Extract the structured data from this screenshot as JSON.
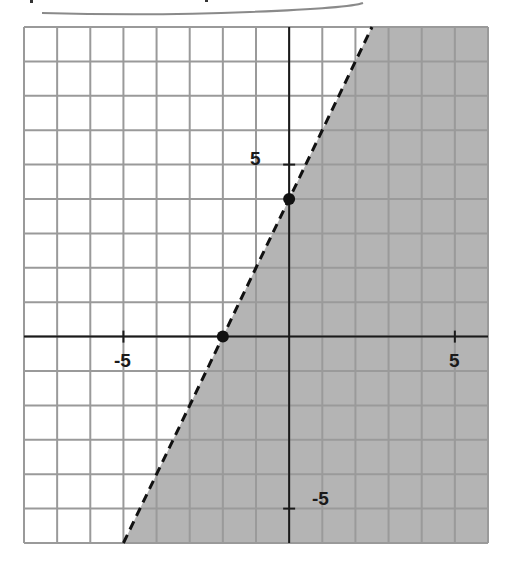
{
  "chart_data": {
    "type": "line",
    "title": "",
    "xlabel": "",
    "ylabel": "",
    "xlim": [
      -8,
      6
    ],
    "ylim": [
      -6,
      9
    ],
    "grid": true,
    "tick_labels": {
      "x": [
        {
          "value": -5,
          "label": "-5"
        },
        {
          "value": 5,
          "label": "5"
        }
      ],
      "y": [
        {
          "value": 5,
          "label": "5"
        },
        {
          "value": -5,
          "label": "-5"
        }
      ]
    },
    "boundary_line": {
      "equation": "y = 2x + 4",
      "slope": 2,
      "intercept": 4,
      "style": "dashed"
    },
    "shaded_region": "y < 2x + 4 (right/below the line)",
    "points": [
      {
        "x": -2,
        "y": 0,
        "label": "x-intercept"
      },
      {
        "x": 0,
        "y": 4,
        "label": "y-intercept"
      }
    ],
    "colors": {
      "shade": "#b4b4b4",
      "grid": "#9a9a9a",
      "axis": "#1a1a1a",
      "line": "#111111"
    }
  },
  "labels": {
    "x_neg5": "-5",
    "x_pos5": "5",
    "y_pos5": "5",
    "y_neg5": "-5"
  }
}
